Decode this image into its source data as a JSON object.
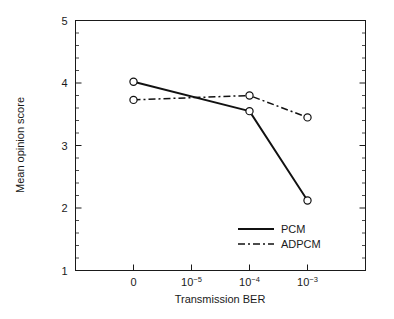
{
  "chart_data": {
    "type": "line",
    "title": "",
    "xlabel": "Transmission BER",
    "ylabel": "Mean opinion score",
    "categories": [
      "0",
      "10-5",
      "10-4",
      "10-3"
    ],
    "category_labels": [
      {
        "base": "0",
        "exp": ""
      },
      {
        "base": "10",
        "exp": "−5"
      },
      {
        "base": "10",
        "exp": "−4"
      },
      {
        "base": "10",
        "exp": "−3"
      }
    ],
    "ylim": [
      1,
      5
    ],
    "ytick_labels": [
      "1",
      "2",
      "3",
      "4",
      "5"
    ],
    "yticks": [
      1,
      2,
      3,
      4,
      5
    ],
    "yminor_step": 0.2,
    "grid": false,
    "legend_position": "lower right inside",
    "marker": "open-circle",
    "series": [
      {
        "name": "PCM",
        "style": "solid",
        "x": [
          "0",
          "10-4",
          "10-3"
        ],
        "values": [
          4.02,
          3.55,
          2.12
        ]
      },
      {
        "name": "ADPCM",
        "style": "dash-dot",
        "x": [
          "0",
          "10-4",
          "10-3"
        ],
        "values": [
          3.73,
          3.8,
          3.45
        ]
      }
    ]
  },
  "legend": {
    "items": [
      {
        "label": "PCM",
        "style": "solid"
      },
      {
        "label": "ADPCM",
        "style": "dash-dot"
      }
    ]
  },
  "colors": {
    "line": "#111111",
    "axis": "#1a1a1a",
    "background": "#ffffff",
    "marker_fill": "#ffffff"
  }
}
